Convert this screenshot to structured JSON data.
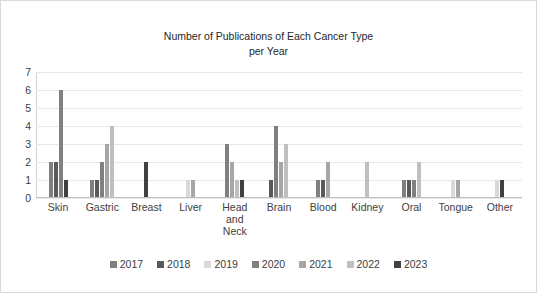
{
  "chart_data": {
    "type": "bar",
    "title": "Number of Publications of Each Cancer Type\nper Year",
    "xlabel": "",
    "ylabel": "",
    "ylim": [
      0,
      7
    ],
    "yticks": [
      0,
      1,
      2,
      3,
      4,
      5,
      6,
      7
    ],
    "grid": true,
    "legend_position": "bottom",
    "categories": [
      "Skin",
      "Gastric",
      "Breast",
      "Liver",
      "Head\nand\nNeck",
      "Brain",
      "Blood",
      "Kidney",
      "Oral",
      "Tongue",
      "Other"
    ],
    "series": [
      {
        "name": "2017",
        "color": "#7f7f7f",
        "values": [
          2,
          1,
          0,
          0,
          0,
          0,
          1,
          0,
          1,
          0,
          0
        ]
      },
      {
        "name": "2018",
        "color": "#595959",
        "values": [
          2,
          1,
          0,
          0,
          0,
          1,
          1,
          0,
          1,
          0,
          0
        ]
      },
      {
        "name": "2019",
        "color": "#d9d9d9",
        "values": [
          0,
          0,
          0,
          1,
          0,
          0,
          0,
          0,
          0,
          1,
          1
        ]
      },
      {
        "name": "2020",
        "color": "#808080",
        "values": [
          6,
          2,
          0,
          0,
          3,
          4,
          0,
          0,
          1,
          0,
          0
        ]
      },
      {
        "name": "2021",
        "color": "#a6a6a6",
        "values": [
          0,
          3,
          0,
          1,
          2,
          2,
          2,
          0,
          0,
          1,
          0
        ]
      },
      {
        "name": "2022",
        "color": "#bfbfbf",
        "values": [
          0,
          4,
          0,
          0,
          1,
          3,
          0,
          2,
          2,
          0,
          0
        ]
      },
      {
        "name": "2023",
        "color": "#404040",
        "values": [
          1,
          0,
          2,
          0,
          1,
          0,
          0,
          0,
          0,
          0,
          1
        ]
      }
    ]
  },
  "legend": {
    "items": [
      {
        "label": "2017"
      },
      {
        "label": "2018"
      },
      {
        "label": "2019"
      },
      {
        "label": "2020"
      },
      {
        "label": "2021"
      },
      {
        "label": "2022"
      },
      {
        "label": "2023"
      }
    ]
  }
}
